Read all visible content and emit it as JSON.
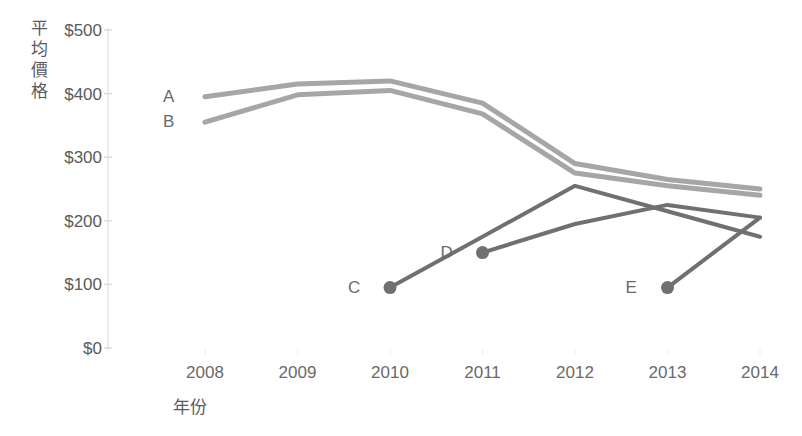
{
  "chart_data": {
    "type": "line",
    "title": "",
    "xlabel": "年份",
    "ylabel": "平均價格",
    "categories": [
      2008,
      2009,
      2010,
      2011,
      2012,
      2013,
      2014
    ],
    "xticklabels": [
      "2008",
      "2009",
      "2010",
      "2011",
      "2012",
      "2013",
      "2014"
    ],
    "yticklabels": [
      "$0",
      "$100",
      "$200",
      "$300",
      "$400",
      "$500"
    ],
    "ytickvalues": [
      0,
      100,
      200,
      300,
      400,
      500
    ],
    "ylim": [
      0,
      500
    ],
    "xlim": [
      2008,
      2014
    ],
    "grid": false,
    "legend": "inline-labels-at-series-start",
    "currency": "$",
    "series": [
      {
        "name": "A",
        "color": "#a6a6a6",
        "x": [
          2008,
          2009,
          2010,
          2011,
          2012,
          2013,
          2014
        ],
        "values": [
          395,
          415,
          420,
          385,
          290,
          265,
          250
        ],
        "markers": false,
        "label_x": 2008,
        "label_y": 395
      },
      {
        "name": "B",
        "color": "#a6a6a6",
        "x": [
          2008,
          2009,
          2010,
          2011,
          2012,
          2013,
          2014
        ],
        "values": [
          355,
          398,
          405,
          368,
          275,
          255,
          240
        ],
        "markers": false,
        "label_x": 2008,
        "label_y": 355
      },
      {
        "name": "C",
        "color": "#707070",
        "x": [
          2010,
          2011,
          2012,
          2013,
          2014
        ],
        "values": [
          95,
          175,
          255,
          215,
          175
        ],
        "markers": true,
        "marker_points": [
          2010
        ],
        "label_x": 2010,
        "label_y": 95
      },
      {
        "name": "D",
        "color": "#707070",
        "x": [
          2011,
          2012,
          2013,
          2014
        ],
        "values": [
          150,
          195,
          225,
          205
        ],
        "markers": true,
        "marker_points": [
          2011
        ],
        "label_x": 2011,
        "label_y": 150
      },
      {
        "name": "E",
        "color": "#707070",
        "x": [
          2013,
          2014
        ],
        "values": [
          95,
          205
        ],
        "markers": true,
        "marker_points": [
          2013
        ],
        "label_x": 2013,
        "label_y": 95
      }
    ]
  },
  "axis": {
    "y_axis_line_color": "#e8e8e8",
    "tick_mark_color": "#d9d9d9"
  }
}
